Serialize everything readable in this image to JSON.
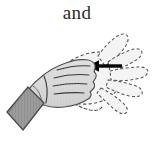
{
  "figure": {
    "caption": "and",
    "alt_description": "Hand gesture diagram: fingers close from spread position, arrow points left",
    "background_color": "#ffffff",
    "width": 154,
    "height": 144
  },
  "colors": {
    "ink": "#2b2b2b",
    "outline": "#3a3a3a",
    "hand_fill": "#dcdcdc",
    "hand_shade": "#c9c9c9",
    "cuff_fill": "#9b9b9b",
    "cuff_stroke": "#4a4a4a",
    "ghost_stroke": "#555555",
    "ghost_fill": "#f2f2f2",
    "arrow": "#000000"
  },
  "elements": {
    "solid_hand": {
      "name": "solid hand",
      "style": "solid gray filled outline",
      "position": "left",
      "state": "fingers closed flat",
      "finger_crease_count": 4
    },
    "ghost_hand": {
      "name": "ghost hand",
      "style": "dashed outline",
      "position": "right",
      "state": "fingers spread open",
      "finger_count": 5
    },
    "cuff": {
      "name": "sleeve cuff",
      "style": "shaded parallelogram",
      "position": "lower left"
    },
    "motion_arrow": {
      "name": "motion arrow",
      "direction": "left",
      "meaning": "fingers move inward to close",
      "start_x": 122,
      "end_x": 88,
      "y": 66
    }
  }
}
